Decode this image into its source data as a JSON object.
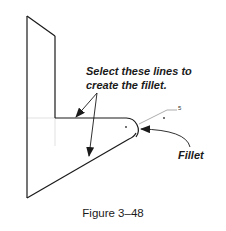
{
  "diagram": {
    "callouts": {
      "select_lines_line1": "Select these lines to",
      "select_lines_line2": "create the fillet.",
      "fillet": "Fillet"
    },
    "dimension_label": "5",
    "caption": "Figure 3–48",
    "colors": {
      "geometry": "#1a1a1a",
      "construction": "#d9d9d9",
      "leader": "#8a8a8a",
      "text": "#1a1a1a"
    }
  }
}
